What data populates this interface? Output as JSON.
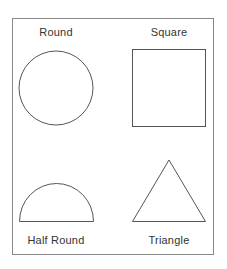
{
  "shapes": [
    {
      "label": "Round",
      "type": "circle"
    },
    {
      "label": "Square",
      "type": "square"
    },
    {
      "label": "Half Round",
      "type": "semicircle"
    },
    {
      "label": "Triangle",
      "type": "triangle"
    }
  ],
  "colors": {
    "stroke": "#555555",
    "frame": "#888888"
  }
}
